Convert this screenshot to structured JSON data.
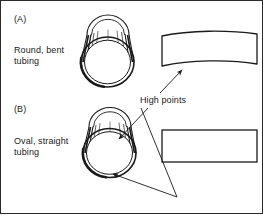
{
  "figure": {
    "border_color": "#2b2b2b",
    "line_color": "#1a1a1a",
    "background": "#ffffff"
  },
  "panels": [
    {
      "id": "A",
      "label": "(A)",
      "caption_line1": "Round, bent",
      "caption_line2": "tubing",
      "caption": "Round, bent tubing",
      "tube_view": "end-view-round-tube",
      "side_view": "bent-tube-profile"
    },
    {
      "id": "B",
      "label": "(B)",
      "caption_line1": "Oval, straight",
      "caption_line2": "tubing",
      "caption": "Oval, straight tubing",
      "tube_view": "end-view-oval-tube",
      "side_view": "straight-tube-profile"
    }
  ],
  "annotations": {
    "high_points_label": "High points",
    "arrow_count": 3
  }
}
